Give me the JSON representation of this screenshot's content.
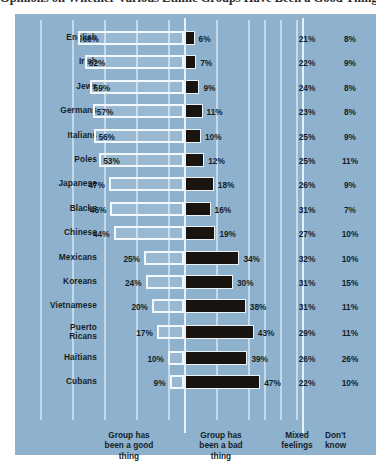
{
  "title": "Opinions on Whether Various Ethnic Groups Have Been a Good Thing or a Bad Thing for This Country",
  "colors": {
    "panel_background": "#8eb2cd",
    "good_bar_outline": "#f2f8fb",
    "bad_bar_fill": "#19140f",
    "gridline": "#d2e2ee",
    "text": "#141e28"
  },
  "legend": {
    "good": "Group has\nbeen a good\nthing",
    "good_l1": "Group has",
    "good_l2": "been a good",
    "good_l3": "thing",
    "bad_l1": "Group has",
    "bad_l2": "been a bad",
    "bad_l3": "thing",
    "mixed_l1": "Mixed",
    "mixed_l2": "feelings",
    "dk_l1": "Don't",
    "dk_l2": "know"
  },
  "chart_data": {
    "type": "bar",
    "title": "Opinions on Whether Various Ethnic Groups Have Been a Good Thing or a Bad Thing for This Country",
    "xlabel": "",
    "ylabel": "",
    "grid": true,
    "legend_position": "bottom",
    "orientation": "horizontal-diverging",
    "categories": [
      "English",
      "Irish",
      "Jews",
      "Germans",
      "Italians",
      "Poles",
      "Japanese",
      "Blacks",
      "Chinese",
      "Mexicans",
      "Koreans",
      "Vietnamese",
      "Puerto Ricans",
      "Haitians",
      "Cubans"
    ],
    "series": [
      {
        "name": "Group has been a good thing",
        "values": [
          66,
          62,
          59,
          57,
          56,
          53,
          47,
          46,
          44,
          25,
          24,
          20,
          17,
          10,
          9
        ],
        "unit": "%"
      },
      {
        "name": "Group has been a bad thing",
        "values": [
          6,
          7,
          9,
          11,
          10,
          12,
          18,
          16,
          19,
          34,
          30,
          38,
          43,
          39,
          47
        ],
        "unit": "%"
      },
      {
        "name": "Mixed feelings",
        "values": [
          21,
          22,
          24,
          23,
          25,
          25,
          26,
          31,
          27,
          32,
          31,
          31,
          29,
          26,
          22
        ],
        "unit": "%"
      },
      {
        "name": "Don't know",
        "values": [
          8,
          9,
          8,
          8,
          9,
          11,
          9,
          7,
          10,
          10,
          15,
          11,
          11,
          26,
          10
        ],
        "unit": "%"
      }
    ]
  },
  "rows": [
    {
      "label": "English",
      "label_l1": "English",
      "label_l2": "",
      "good": "66%",
      "bad": "6%",
      "mixed": "21%",
      "dk": "8%",
      "good_val": 66,
      "bad_val": 6
    },
    {
      "label": "Irish",
      "label_l1": "Irish",
      "label_l2": "",
      "good": "62%",
      "bad": "7%",
      "mixed": "22%",
      "dk": "9%",
      "good_val": 62,
      "bad_val": 7
    },
    {
      "label": "Jews",
      "label_l1": "Jews",
      "label_l2": "",
      "good": "59%",
      "bad": "9%",
      "mixed": "24%",
      "dk": "8%",
      "good_val": 59,
      "bad_val": 9
    },
    {
      "label": "Germans",
      "label_l1": "Germans",
      "label_l2": "",
      "good": "57%",
      "bad": "11%",
      "mixed": "23%",
      "dk": "8%",
      "good_val": 57,
      "bad_val": 11
    },
    {
      "label": "Italians",
      "label_l1": "Italians",
      "label_l2": "",
      "good": "56%",
      "bad": "10%",
      "mixed": "25%",
      "dk": "9%",
      "good_val": 56,
      "bad_val": 10
    },
    {
      "label": "Poles",
      "label_l1": "Poles",
      "label_l2": "",
      "good": "53%",
      "bad": "12%",
      "mixed": "25%",
      "dk": "11%",
      "good_val": 53,
      "bad_val": 12
    },
    {
      "label": "Japanese",
      "label_l1": "Japanese",
      "label_l2": "",
      "good": "47%",
      "bad": "18%",
      "mixed": "26%",
      "dk": "9%",
      "good_val": 47,
      "bad_val": 18
    },
    {
      "label": "Blacks",
      "label_l1": "Blacks",
      "label_l2": "",
      "good": "46%",
      "bad": "16%",
      "mixed": "31%",
      "dk": "7%",
      "good_val": 46,
      "bad_val": 16
    },
    {
      "label": "Chinese",
      "label_l1": "Chinese",
      "label_l2": "",
      "good": "44%",
      "bad": "19%",
      "mixed": "27%",
      "dk": "10%",
      "good_val": 44,
      "bad_val": 19
    },
    {
      "label": "Mexicans",
      "label_l1": "Mexicans",
      "label_l2": "",
      "good": "25%",
      "bad": "34%",
      "mixed": "32%",
      "dk": "10%",
      "good_val": 25,
      "bad_val": 34
    },
    {
      "label": "Koreans",
      "label_l1": "Koreans",
      "label_l2": "",
      "good": "24%",
      "bad": "30%",
      "mixed": "31%",
      "dk": "15%",
      "good_val": 24,
      "bad_val": 30
    },
    {
      "label": "Vietnamese",
      "label_l1": "Vietnamese",
      "label_l2": "",
      "good": "20%",
      "bad": "38%",
      "mixed": "31%",
      "dk": "11%",
      "good_val": 20,
      "bad_val": 38
    },
    {
      "label": "Puerto Ricans",
      "label_l1": "Puerto",
      "label_l2": "Ricans",
      "good": "17%",
      "bad": "43%",
      "mixed": "29%",
      "dk": "11%",
      "good_val": 17,
      "bad_val": 43
    },
    {
      "label": "Haitians",
      "label_l1": "Haitians",
      "label_l2": "",
      "good": "10%",
      "bad": "39%",
      "mixed": "26%",
      "dk": "26%",
      "good_val": 10,
      "bad_val": 39
    },
    {
      "label": "Cubans",
      "label_l1": "Cubans",
      "label_l2": "",
      "good": "9%",
      "bad": "47%",
      "mixed": "22%",
      "dk": "10%",
      "good_val": 9,
      "bad_val": 47
    }
  ]
}
